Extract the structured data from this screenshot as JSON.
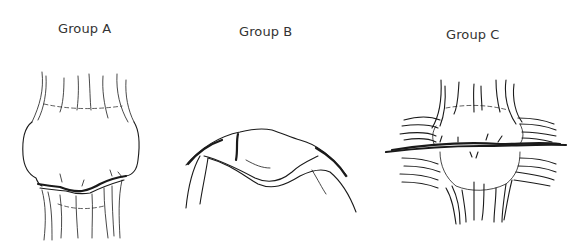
{
  "figure": {
    "panels": [
      {
        "id": "A",
        "label": "Group A",
        "depiction": "joint-with-irregular-cartilage-line"
      },
      {
        "id": "B",
        "label": "Group B",
        "depiction": "flattened-dome-joint-surface"
      },
      {
        "id": "C",
        "label": "Group C",
        "depiction": "joint-with-horizontal-fissure-and-fibrous-strands"
      }
    ],
    "colors": {
      "ink": "#1a1a1a",
      "label": "#333333",
      "background": "#ffffff"
    }
  }
}
